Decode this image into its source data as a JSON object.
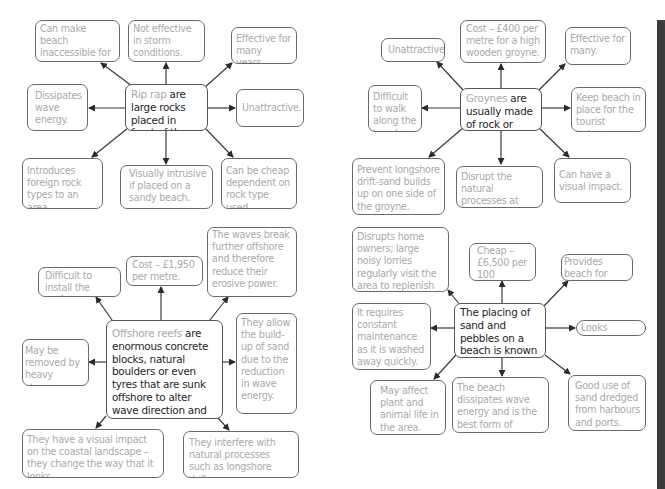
{
  "diagrams": [
    {
      "id": "rip-rap",
      "center": {
        "term": "Rip rap",
        "text": " are large rocks placed in front of the cliff."
      },
      "nodes": [
        "Can make beach inaccessible for tourists.",
        "Not effective in storm conditions.",
        "Effective for many years.",
        "Dissipates wave energy.",
        "Unattractive.",
        "Introduces foreign rock types to an area.",
        "Visually intrusive if placed on a sandy beach.",
        "Can be cheap dependent on rock type used."
      ]
    },
    {
      "id": "groynes",
      "center": {
        "term": "Groynes",
        "text": " are usually made of rock or wood."
      },
      "nodes": [
        "Unattractive.",
        "Cost – £400 per metre for a high wooden groyne.",
        "Effective for many.",
        "Difficult to walk along the beach.",
        "Keep beach in place for the tourist industry.",
        "Prevent longshore drift-sand builds up on one side of the groyne.",
        "Disrupt the natural processes at work on the beach.",
        "Can have a visual impact."
      ]
    },
    {
      "id": "offshore-reefs",
      "center": {
        "term": "Offshore reefs",
        "text": " are enormous concrete blocks, natural boulders or even tyres that are sunk offshore to alter wave direction and dissipate wave energy."
      },
      "nodes": [
        "Difficult to install the reefs.",
        "Cost – £1,950 per metre.",
        "The waves break further offshore and therefore reduce their erosive power.",
        "May be removed by heavy storms.",
        "They allow the build-up of sand due to the reduction in wave energy.",
        "They have a visual impact on the coastal landscape – they change the way that it looks.",
        "They interfere with natural processes such as longshore drift."
      ]
    },
    {
      "id": "beach-nourishment",
      "center": {
        "prefix": "The placing of sand and pebbles on a beach is known as ",
        "term": "beach nourishment."
      },
      "nodes": [
        "Disrupts home owners; large noisy lorries regularly visit the area to replenish the beach.",
        "Cheap – £6,500 per 100 metres.",
        "Provides beach for tourists.",
        "It requires constant maintenance as it is washed away quickly.",
        "Looks natural.",
        "May affect plant and animal life in the area.",
        "The beach dissipates wave energy and is the best form of natural defence.",
        "Good use of sand dredged from harbours and ports."
      ]
    }
  ]
}
